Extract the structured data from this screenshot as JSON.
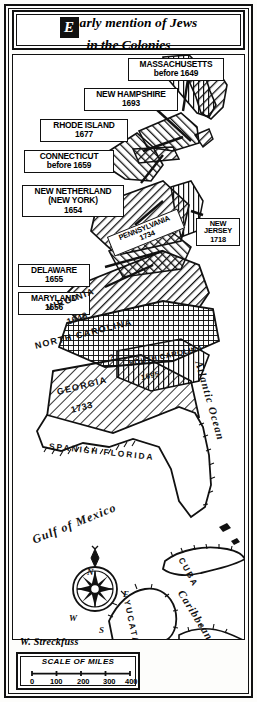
{
  "title": {
    "drop_cap": "E",
    "line1": "arly mention of Jews",
    "line2": "in the Colonies"
  },
  "colony_labels": [
    {
      "name": "MASSACHUSETTS",
      "year": "before 1649"
    },
    {
      "name": "NEW HAMPSHIRE",
      "year": "1693"
    },
    {
      "name": "RHODE ISLAND",
      "year": "1677"
    },
    {
      "name": "CONNECTICUT",
      "year": "before 1659"
    },
    {
      "name": "NEW NETHERLAND",
      "alt": "(NEW YORK)",
      "year": "1654"
    },
    {
      "name": "NEW JERSEY",
      "year": "1718"
    },
    {
      "name": "DELAWARE",
      "year": "1655"
    },
    {
      "name": "MARYLAND",
      "year": "1656"
    },
    {
      "name": "PENNSYLVANIA",
      "year": "1734"
    }
  ],
  "map_names": [
    {
      "name": "VIRGINIA",
      "year": "1648"
    },
    {
      "name": "NORTH CAROLINA",
      "year": "?"
    },
    {
      "name": "SOUTH CAROLINA",
      "year": "1695"
    },
    {
      "name": "GEORGIA",
      "year": "1733"
    },
    {
      "name": "SPANISH FLORIDA"
    },
    {
      "name": "CUBA"
    },
    {
      "name": "YUCATAN"
    }
  ],
  "water_labels": [
    {
      "name": "Atlantic Ocean"
    },
    {
      "name": "Gulf of Mexico"
    },
    {
      "name": "Caribbean Sea"
    }
  ],
  "compass": {
    "north": "N",
    "east": "E",
    "south": "S",
    "west": "W"
  },
  "signature": "W. Streckfuss",
  "scale": {
    "title": "SCALE OF MILES",
    "ticks": [
      "0",
      "100",
      "200",
      "300",
      "400"
    ]
  },
  "colors": {
    "ink": "#111111",
    "paper": "#ffffff"
  }
}
